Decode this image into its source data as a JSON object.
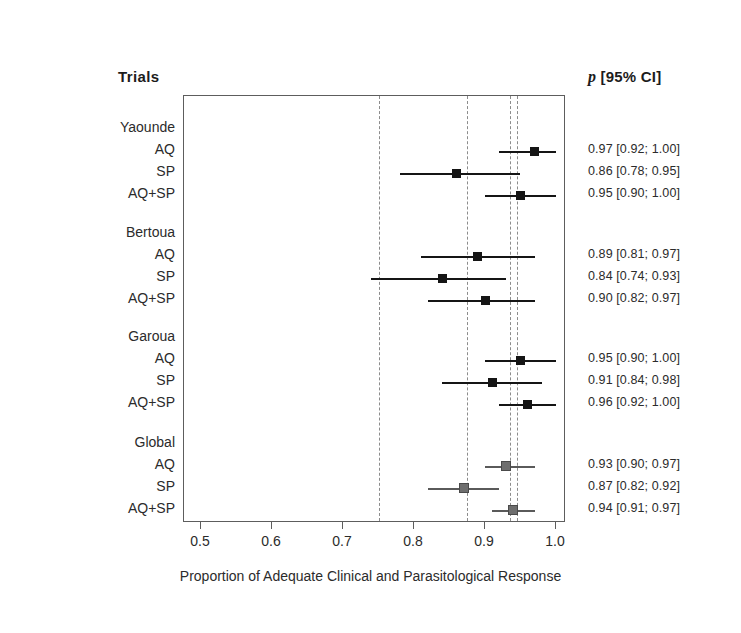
{
  "headers": {
    "trials": "Trials",
    "ci_p": "p",
    "ci_rest": " [95% CI]"
  },
  "axis": {
    "title": "Proportion of Adequate Clinical and Parasitological Response",
    "ticks": [
      "0.5",
      "0.6",
      "0.7",
      "0.8",
      "0.9",
      "1.0"
    ],
    "tick_values": [
      0.5,
      0.6,
      0.7,
      0.8,
      0.9,
      1.0
    ],
    "xlim": [
      0.5,
      1.0
    ]
  },
  "reference_lines": [
    0.75,
    0.875,
    0.935,
    0.945
  ],
  "colors": {
    "marker_trial": "#151515",
    "marker_pooled": "#6e6e6e",
    "line_trial": "#151515",
    "line_pooled": "#5a5a5a",
    "frame": "#5d5d5d",
    "refline": "#8c8c8c",
    "text": "#2b2b2b"
  },
  "chart_data": {
    "type": "scatter",
    "title": "",
    "xlabel": "Proportion of Adequate Clinical and Parasitological Response",
    "ylabel": "",
    "xlim": [
      0.5,
      1.0
    ],
    "grid": false,
    "legend": "none",
    "plot_kind": "forest-plot",
    "reference_lines": [
      0.75,
      0.875,
      0.935,
      0.945
    ],
    "groups": [
      {
        "name": "Yaounde",
        "pooled": false,
        "rows": [
          {
            "label": "AQ",
            "estimate": 0.97,
            "low": 0.92,
            "high": 1.0,
            "ci_text": "0.97 [0.92; 1.00]"
          },
          {
            "label": "SP",
            "estimate": 0.86,
            "low": 0.78,
            "high": 0.95,
            "ci_text": "0.86 [0.78; 0.95]"
          },
          {
            "label": "AQ+SP",
            "estimate": 0.95,
            "low": 0.9,
            "high": 1.0,
            "ci_text": "0.95 [0.90; 1.00]"
          }
        ]
      },
      {
        "name": "Bertoua",
        "pooled": false,
        "rows": [
          {
            "label": "AQ",
            "estimate": 0.89,
            "low": 0.81,
            "high": 0.97,
            "ci_text": "0.89 [0.81; 0.97]"
          },
          {
            "label": "SP",
            "estimate": 0.84,
            "low": 0.74,
            "high": 0.93,
            "ci_text": "0.84 [0.74; 0.93]"
          },
          {
            "label": "AQ+SP",
            "estimate": 0.9,
            "low": 0.82,
            "high": 0.97,
            "ci_text": "0.90 [0.82; 0.97]"
          }
        ]
      },
      {
        "name": "Garoua",
        "pooled": false,
        "rows": [
          {
            "label": "AQ",
            "estimate": 0.95,
            "low": 0.9,
            "high": 1.0,
            "ci_text": "0.95 [0.90; 1.00]"
          },
          {
            "label": "SP",
            "estimate": 0.91,
            "low": 0.84,
            "high": 0.98,
            "ci_text": "0.91 [0.84; 0.98]"
          },
          {
            "label": "AQ+SP",
            "estimate": 0.96,
            "low": 0.92,
            "high": 1.0,
            "ci_text": "0.96 [0.92; 1.00]"
          }
        ]
      },
      {
        "name": "Global",
        "pooled": true,
        "rows": [
          {
            "label": "AQ",
            "estimate": 0.93,
            "low": 0.9,
            "high": 0.97,
            "ci_text": "0.93 [0.90; 0.97]"
          },
          {
            "label": "SP",
            "estimate": 0.87,
            "low": 0.82,
            "high": 0.92,
            "ci_text": "0.87 [0.82; 0.92]"
          },
          {
            "label": "AQ+SP",
            "estimate": 0.94,
            "low": 0.91,
            "high": 0.97,
            "ci_text": "0.94 [0.91; 0.97]"
          }
        ]
      }
    ]
  }
}
